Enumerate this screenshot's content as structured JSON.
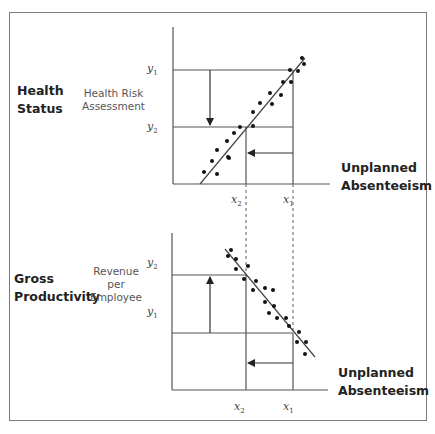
{
  "figure": {
    "top_panel": {
      "category_label_line1": "Health",
      "category_label_line2": "Status",
      "measure_label_line1": "Health Risk",
      "measure_label_line2": "Assessment",
      "y_labels": {
        "y1": "y",
        "y1_sub": "1",
        "y2": "y",
        "y2_sub": "2"
      },
      "x_labels": {
        "x2": "x",
        "x2_sub": "2",
        "x1": "x",
        "x1_sub": "1"
      },
      "x_axis_title_line1": "Unplanned",
      "x_axis_title_line2": "Absenteeism",
      "relationship": "positive"
    },
    "bottom_panel": {
      "category_label_line1": "Gross",
      "category_label_line2": "Productivity",
      "measure_label_line1": "Revenue",
      "measure_label_line2": "per",
      "measure_label_line3": "Employee",
      "y_labels": {
        "y2": "y",
        "y2_sub": "2",
        "y1": "y",
        "y1_sub": "1"
      },
      "x_labels": {
        "x2": "x",
        "x2_sub": "2",
        "x1": "x",
        "x1_sub": "1"
      },
      "x_axis_title_line1": "Unplanned",
      "x_axis_title_line2": "Absenteeism",
      "relationship": "negative"
    },
    "colors": {
      "line": "#555555",
      "dots": "#111111",
      "border": "#7a7a7a"
    }
  }
}
